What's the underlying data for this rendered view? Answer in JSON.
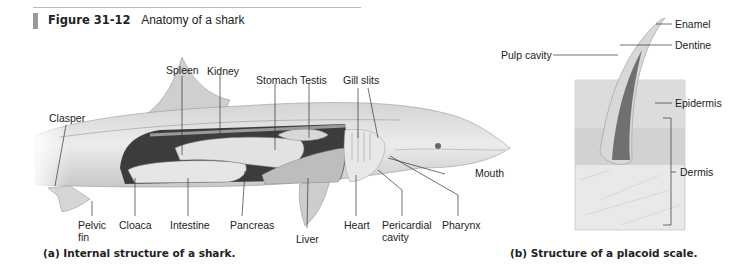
{
  "figure": {
    "number": "Figure 31-12",
    "title": "Anatomy of a shark"
  },
  "panel_a": {
    "caption": "(a) Internal structure of a shark.",
    "labels": {
      "spleen": "Spleen",
      "kidney": "Kidney",
      "stomach": "Stomach",
      "testis": "Testis",
      "gill_slits": "Gill slits",
      "clasper": "Clasper",
      "mouth": "Mouth",
      "pelvic_fin_1": "Pelvic",
      "pelvic_fin_2": "fin",
      "cloaca": "Cloaca",
      "intestine": "Intestine",
      "pancreas": "Pancreas",
      "liver": "Liver",
      "heart": "Heart",
      "pericardial_1": "Pericardial",
      "pericardial_2": "cavity",
      "pharynx": "Pharynx"
    }
  },
  "panel_b": {
    "caption": "(b) Structure of a placoid scale.",
    "labels": {
      "enamel": "Enamel",
      "pulp_cavity": "Pulp cavity",
      "dentine": "Dentine",
      "epidermis": "Epidermis",
      "dermis": "Dermis"
    }
  }
}
